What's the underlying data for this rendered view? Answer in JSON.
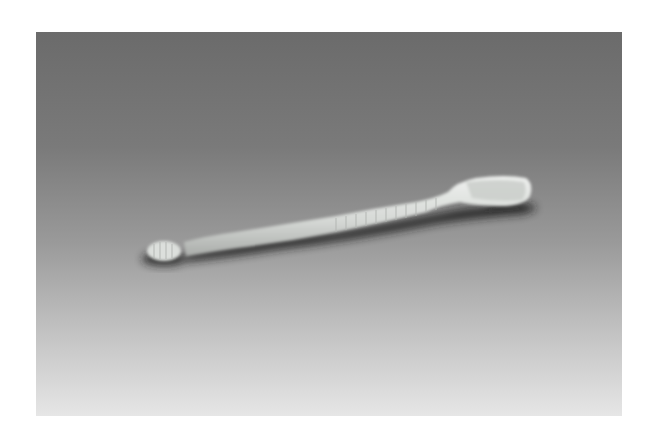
{
  "photo": {
    "subject": "soft plastic fishing lure worm",
    "background_top_color": "#6b6b6b",
    "background_bottom_color": "#e6e6e6",
    "lure_color": "#d8dcd8",
    "shadow_color": "#1e1e1e"
  }
}
